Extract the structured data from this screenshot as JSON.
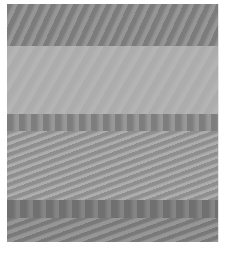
{
  "image": {
    "description": "Grayscale photo of horizontal bands with moire wave patterns",
    "bands": [
      {
        "name": "dark-diagonal-waves",
        "color": "#8a8a8a"
      },
      {
        "name": "light-smooth",
        "color": "#b2b2b2"
      },
      {
        "name": "dark-vertical-stripes",
        "color": "#8f8f8f"
      },
      {
        "name": "medium-diagonal-waves",
        "color": "#a2a2a2"
      },
      {
        "name": "dark-vertical-stripes",
        "color": "#7d7d7d"
      },
      {
        "name": "dark-diagonal-waves",
        "color": "#8a8a8a"
      }
    ]
  }
}
